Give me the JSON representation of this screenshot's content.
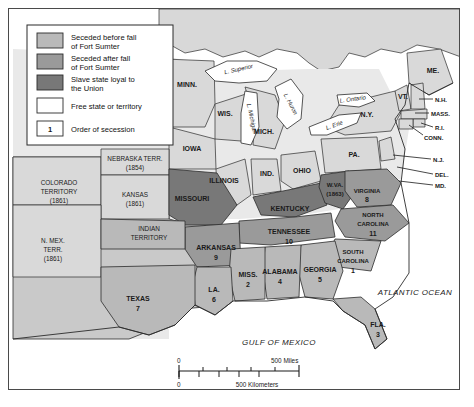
{
  "map": {
    "title": "Secession of the Southern States",
    "colors": {
      "seceded_before": "#b9b9b9",
      "seceded_after": "#9a9a9a",
      "slave_loyal": "#787878",
      "free": "#ffffff",
      "water": "#ffffff",
      "outline": "#2b2b2b",
      "frame": "#4a4a4a"
    },
    "legend": {
      "items": [
        {
          "label": "Seceded before fall\nof Fort Sumter",
          "line1": "Seceded before fall",
          "line2": "of Fort Sumter",
          "swatch": "#b9b9b9"
        },
        {
          "label": "Seceded after fall\nof Fort Sumter",
          "line1": "Seceded after fall",
          "line2": "of Fort Sumter",
          "swatch": "#9a9a9a"
        },
        {
          "label": "Slave state loyal to\nthe Union",
          "line1": "Slave state loyal to",
          "line2": "the Union",
          "swatch": "#787878"
        },
        {
          "label": "Free state or territory",
          "line1": "Free state or territory",
          "line2": "",
          "swatch": "#ffffff"
        }
      ],
      "order_key": {
        "symbol": "1",
        "label": "Order of secession"
      }
    },
    "scale_bar": {
      "miles": {
        "start": "0",
        "end": "500 Miles"
      },
      "kilometers": {
        "start": "0",
        "end": "500 Kilometers"
      }
    },
    "water_labels": [
      {
        "name": "L. Superior",
        "x": 226,
        "y": 64,
        "rot": -14
      },
      {
        "name": "L. Michigan",
        "x": 163,
        "y": 95,
        "rot": 74
      },
      {
        "name": "L. Huron",
        "x": 281,
        "y": 86,
        "rot": 62
      },
      {
        "name": "L. Erie",
        "x": 334,
        "y": 109,
        "rot": 20
      },
      {
        "name": "L. Ontario",
        "x": 342,
        "y": 91,
        "rot": -12
      }
    ],
    "ocean_labels": [
      {
        "name": "ATLANTIC OCEAN",
        "x": 410,
        "y": 288
      },
      {
        "name": "GULF OF MEXICO",
        "x": 274,
        "y": 335
      }
    ],
    "states": [
      {
        "name": "MINN.",
        "x": 178,
        "y": 75,
        "cat": "free"
      },
      {
        "name": "WIS.",
        "x": 216,
        "y": 104,
        "cat": "free"
      },
      {
        "name": "IOWA",
        "x": 183,
        "y": 139,
        "cat": "free"
      },
      {
        "name": "MICH.",
        "x": 253,
        "y": 122,
        "cat": "free"
      },
      {
        "name": "ILLINOIS",
        "x": 215,
        "y": 171,
        "cat": "free"
      },
      {
        "name": "IND.",
        "x": 258,
        "y": 164,
        "cat": "free"
      },
      {
        "name": "OHIO",
        "x": 293,
        "y": 161,
        "cat": "free"
      },
      {
        "name": "PA.",
        "x": 348,
        "y": 145,
        "cat": "free"
      },
      {
        "name": "N.Y.",
        "x": 363,
        "y": 104,
        "cat": "free"
      },
      {
        "name": "ME.",
        "x": 427,
        "y": 63,
        "cat": "free"
      },
      {
        "name": "VT.",
        "x": 389,
        "y": 88,
        "cat": "free"
      }
    ],
    "labeled_small_states": [
      {
        "name": "N.H.",
        "x": 432,
        "y": 92
      },
      {
        "name": "MASS.",
        "x": 436,
        "y": 104
      },
      {
        "name": "R.I.",
        "x": 432,
        "y": 119
      },
      {
        "name": "CONN.",
        "x": 428,
        "y": 129
      },
      {
        "name": "N.J.",
        "x": 430,
        "y": 152
      },
      {
        "name": "DEL.",
        "x": 432,
        "y": 166
      },
      {
        "name": "MD.",
        "x": 432,
        "y": 177
      }
    ],
    "confederate_states": [
      {
        "name": "SOUTH\nCAROLINA",
        "line1": "SOUTH",
        "line2": "CAROLINA",
        "order": "1",
        "x": 344,
        "y": 250,
        "cat": "seceded_before"
      },
      {
        "name": "MISS.",
        "line1": "MISS.",
        "line2": "",
        "order": "2",
        "x": 239,
        "y": 270,
        "cat": "seceded_before"
      },
      {
        "name": "FLA.",
        "line1": "FLA.",
        "line2": "",
        "order": "3",
        "x": 371,
        "y": 318,
        "cat": "seceded_before"
      },
      {
        "name": "ALABAMA",
        "line1": "ALABAMA",
        "line2": "",
        "order": "4",
        "x": 271,
        "y": 267,
        "cat": "seceded_before"
      },
      {
        "name": "GEORGIA",
        "line1": "GEORGIA",
        "line2": "",
        "order": "5",
        "x": 311,
        "y": 265,
        "cat": "seceded_before"
      },
      {
        "name": "LA.",
        "line1": "LA.",
        "line2": "",
        "order": "6",
        "x": 207,
        "y": 285,
        "cat": "seceded_before"
      },
      {
        "name": "TEXAS",
        "line1": "TEXAS",
        "line2": "",
        "order": "7",
        "x": 129,
        "y": 294,
        "cat": "seceded_before"
      },
      {
        "name": "VIRGINIA",
        "line1": "VIRGINIA",
        "line2": "",
        "order": "8",
        "x": 356,
        "y": 185,
        "cat": "seceded_after"
      },
      {
        "name": "ARKANSAS",
        "line1": "ARKANSAS",
        "line2": "",
        "order": "9",
        "x": 209,
        "y": 243,
        "cat": "seceded_after"
      },
      {
        "name": "TENNESSEE",
        "line1": "TENNESSEE",
        "line2": "",
        "order": "10",
        "x": 280,
        "y": 228,
        "cat": "seceded_after"
      },
      {
        "name": "NORTH\nCAROLINA",
        "line1": "NORTH",
        "line2": "CAROLINA",
        "order": "11",
        "x": 365,
        "y": 213,
        "cat": "seceded_after"
      }
    ],
    "border_states": [
      {
        "name": "MISSOURI",
        "line1": "MISSOURI",
        "line2": "",
        "x": 183,
        "y": 190,
        "cat": "slave_loyal"
      },
      {
        "name": "KENTUCKY",
        "line1": "KENTUCKY",
        "line2": "",
        "x": 281,
        "y": 200,
        "cat": "slave_loyal"
      },
      {
        "name": "W.VA.\n(1863)",
        "line1": "W.VA.",
        "line2": "(1863)",
        "x": 326,
        "y": 179,
        "cat": "slave_loyal"
      }
    ],
    "territories": [
      {
        "line1": "COLORADO",
        "line2": "TERRITORY",
        "line3": "(1861)",
        "x": 67,
        "y": 181
      },
      {
        "line1": "NEBRASKA TERR.",
        "line2": "(1854)",
        "line3": "",
        "x": 128,
        "y": 156
      },
      {
        "line1": "KANSAS",
        "line2": "(1861)",
        "line3": "",
        "x": 133,
        "y": 195
      },
      {
        "line1": "INDIAN",
        "line2": "TERRITORY",
        "line3": "",
        "x": 145,
        "y": 237
      },
      {
        "line1": "N. MEX.",
        "line2": "TERR.",
        "line3": "(1861)",
        "x": 50,
        "y": 245
      }
    ]
  }
}
